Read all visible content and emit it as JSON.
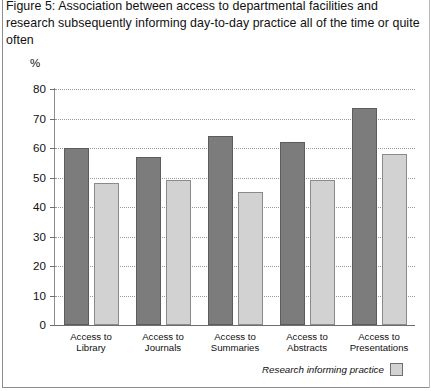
{
  "figure": {
    "title": "Figure 5: Association between access to departmental facilities and research subsequently informing day-to-day practice all of the time or quite often",
    "y_axis_unit": "%"
  },
  "legend": {
    "label": "Research informing practice",
    "swatch_color": "#d2d2d2"
  },
  "colors": {
    "dark_bar": "#7c7c7c",
    "light_bar": "#d2d2d2",
    "axis": "#6e6e6e",
    "grid": "#9a9a9a"
  },
  "chart_data": {
    "type": "bar",
    "title": "Figure 5: Association between access to departmental facilities and research subsequently informing day-to-day practice all of the time or quite often",
    "xlabel": "",
    "ylabel": "%",
    "ylim": [
      0,
      80
    ],
    "yticks": [
      0,
      10,
      20,
      30,
      40,
      50,
      60,
      70,
      80
    ],
    "ytick_labels": [
      "0",
      "10",
      "20",
      "30",
      "40",
      "50",
      "60",
      "70",
      "80"
    ],
    "grid": true,
    "legend_position": "bottom-right",
    "categories": [
      "Access to\nLibrary",
      "Access to\nJournals",
      "Access to\nSummaries",
      "Access to\nAbstracts",
      "Access to\nPresentations"
    ],
    "series": [
      {
        "name": "Access",
        "color": "#7c7c7c",
        "values": [
          60,
          57,
          64,
          62,
          73.5
        ]
      },
      {
        "name": "Research informing practice",
        "color": "#d2d2d2",
        "values": [
          48,
          49,
          45,
          49,
          58
        ]
      }
    ]
  }
}
